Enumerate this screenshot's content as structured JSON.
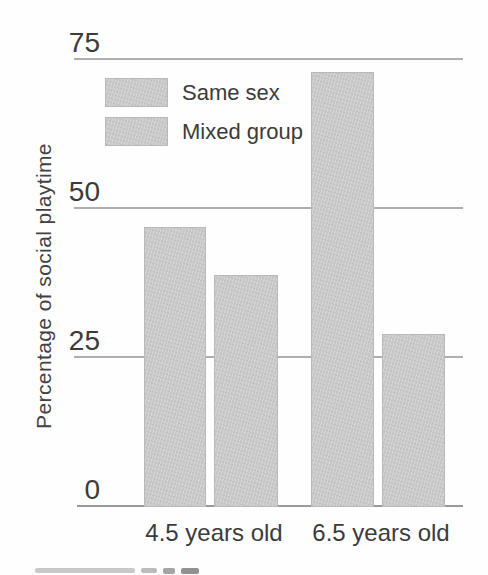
{
  "figure": {
    "background": "#fefefe",
    "text_color": "#3b3b3b",
    "grid_color": "#aeaeae",
    "baseline_color": "#9a9a9a"
  },
  "chart_data": {
    "type": "bar",
    "categories": [
      "4.5 years old",
      "6.5 years old"
    ],
    "series": [
      {
        "name": "Same sex",
        "values": [
          47,
          73
        ]
      },
      {
        "name": "Mixed group",
        "values": [
          39,
          29
        ]
      }
    ],
    "title": "",
    "xlabel": "",
    "ylabel": "Percentage of social playtime",
    "ylim": [
      0,
      75
    ],
    "yticks": [
      0,
      25,
      50,
      75
    ],
    "units": "percent",
    "grid": true,
    "legend_position": "upper-left-inside",
    "bar_color": "#c9c9c9"
  }
}
